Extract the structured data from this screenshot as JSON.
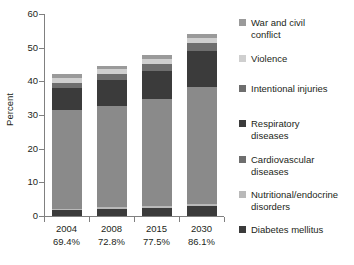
{
  "figure": {
    "title_remnant": "",
    "axis_label_y": "Percent"
  },
  "chart_data": {
    "type": "bar",
    "subtype": "stacked",
    "title": "",
    "xlabel": "",
    "ylabel": "Percent",
    "ylim": [
      0,
      60
    ],
    "yticks": [
      0,
      10,
      20,
      30,
      40,
      50,
      60
    ],
    "grid": false,
    "legend_position": "right",
    "categories": [
      "2004",
      "2008",
      "2015",
      "2030"
    ],
    "category_sublabels": [
      "69.4%",
      "72.8%",
      "77.5%",
      "86.1%"
    ],
    "series": [
      {
        "name": "Diabetes mellitus",
        "color": "#3b3b3b",
        "values": [
          1.7,
          2.2,
          2.5,
          3.0
        ]
      },
      {
        "name": "Nutritional/endocrine disorders",
        "color": "#b9b9b9",
        "values": [
          0.5,
          0.5,
          0.5,
          0.5
        ]
      },
      {
        "name": "Cardiovascular diseases",
        "color": "#8a8a8a",
        "values": [
          29.4,
          30.1,
          31.9,
          34.9
        ]
      },
      {
        "name": "Respiratory diseases",
        "color": "#3b3b3b",
        "values": [
          6.4,
          7.7,
          8.2,
          10.7
        ]
      },
      {
        "name": "Intentional injuries",
        "color": "#6e6e6e",
        "values": [
          1.5,
          1.6,
          2.0,
          2.3
        ]
      },
      {
        "name": "Violence",
        "color": "#cfcfcf",
        "values": [
          1.6,
          1.5,
          1.6,
          1.5
        ]
      },
      {
        "name": "War and civil conflict",
        "color": "#9a9a9a",
        "values": [
          1.1,
          0.9,
          1.1,
          1.1
        ]
      }
    ],
    "totals": [
      42.2,
      44.5,
      47.8,
      54.0
    ]
  },
  "legend": {
    "items": [
      {
        "label": "War and civil\nconflict",
        "color": "#9a9a9a"
      },
      {
        "label": "Violence",
        "color": "#cfcfcf"
      },
      {
        "label": "Intentional injuries",
        "color": "#6e6e6e"
      },
      {
        "label": "Respiratory\ndiseases",
        "color": "#3b3b3b"
      },
      {
        "label": "Cardiovascular\ndiseases",
        "color": "#6e6e6e"
      },
      {
        "label": "Nutritional/endocrine\ndisorders",
        "color": "#b9b9b9"
      },
      {
        "label": "Diabetes mellitus",
        "color": "#3b3b3b"
      }
    ]
  }
}
